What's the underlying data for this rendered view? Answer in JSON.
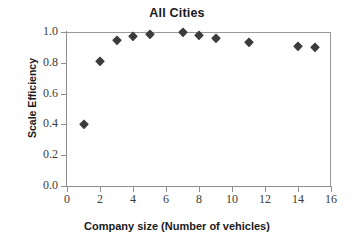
{
  "chart_data": {
    "type": "scatter",
    "title": "All Cities",
    "xlabel": "Company size (Number of vehicles)",
    "ylabel": "Scale Efficiency",
    "xlim": [
      0,
      16
    ],
    "ylim": [
      0.0,
      1.0
    ],
    "xticks": [
      "0",
      "2",
      "4",
      "6",
      "8",
      "10",
      "12",
      "14",
      "16"
    ],
    "xtick_values": [
      0,
      2,
      4,
      6,
      8,
      10,
      12,
      14,
      16
    ],
    "yticks": [
      "0.0",
      "0.2",
      "0.4",
      "0.6",
      "0.8",
      "1.0"
    ],
    "ytick_values": [
      0.0,
      0.2,
      0.4,
      0.6,
      0.8,
      1.0
    ],
    "grid": false,
    "legend": null,
    "marker": "diamond",
    "marker_color": "#3c3c3c",
    "series": [
      {
        "name": "All Cities",
        "x": [
          1,
          2,
          3,
          4,
          5,
          7,
          8,
          9,
          11,
          14,
          15
        ],
        "y": [
          0.4,
          0.81,
          0.95,
          0.975,
          0.985,
          1.0,
          0.98,
          0.96,
          0.935,
          0.91,
          0.9
        ]
      }
    ]
  },
  "colors": {
    "axis": "#8f8f8f",
    "text": "#1a1a1a",
    "tick_text": "#3b3b3b",
    "marker": "#3c3c3c",
    "background": "#ffffff"
  }
}
